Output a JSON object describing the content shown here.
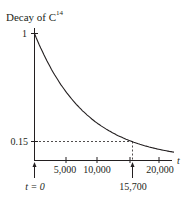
{
  "chart_data": {
    "type": "line",
    "title": "Decay of C",
    "title_superscript": "14",
    "xlabel": "t",
    "ylabel": "",
    "xlim": [
      0,
      22500
    ],
    "ylim": [
      0,
      1
    ],
    "grid": false,
    "legend": null,
    "x_ticks": [
      {
        "value": 5000,
        "label": "5,000"
      },
      {
        "value": 10000,
        "label": "10,000"
      },
      {
        "value": 20000,
        "label": "20,000"
      }
    ],
    "y_ticks": [
      {
        "value": 1,
        "label": "1"
      },
      {
        "value": 0.15,
        "label": "0.15"
      }
    ],
    "annotations": [
      {
        "type": "arrow",
        "at_x": 0,
        "label": "t = 0"
      },
      {
        "type": "arrow",
        "at_x": 15700,
        "label": "15,700"
      },
      {
        "type": "dashed-guide",
        "x": 15700,
        "y": 0.15
      }
    ],
    "series": [
      {
        "name": "C14 remaining fraction",
        "x": [
          0,
          2500,
          5000,
          7500,
          10000,
          12500,
          15000,
          15700,
          17500,
          20000,
          22500
        ],
        "values": [
          1.0,
          0.739,
          0.546,
          0.404,
          0.298,
          0.221,
          0.163,
          0.15,
          0.12,
          0.089,
          0.066
        ]
      }
    ],
    "half_life": 5730
  },
  "labels": {
    "title_main": "Decay of C",
    "title_sup": "14",
    "y_one": "1",
    "y_015": "0.15",
    "x_5000": "5,000",
    "x_10000": "10,000",
    "x_20000": "20,000",
    "x_axis_label": "t",
    "t_zero": "t = 0",
    "t_15700": "15,700"
  }
}
